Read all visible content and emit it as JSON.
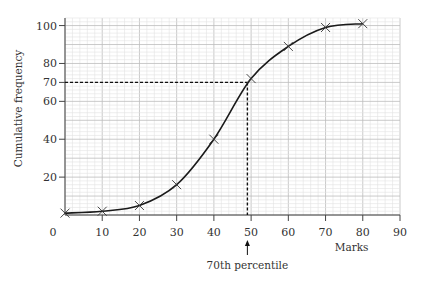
{
  "chart_data": {
    "type": "line",
    "title": "",
    "xlabel": "Marks",
    "ylabel": "Cumulative frequency",
    "xlim": [
      0,
      90
    ],
    "ylim": [
      0,
      104
    ],
    "x_ticks": [
      0,
      10,
      20,
      30,
      40,
      50,
      60,
      70,
      80,
      90
    ],
    "x_tick_labels": [
      "0",
      "10",
      "20",
      "30",
      "40",
      "50",
      "60",
      "70",
      "80",
      "90"
    ],
    "y_ticks": [
      20,
      40,
      60,
      70,
      80,
      100
    ],
    "y_tick_labels": [
      "20",
      "40",
      "60",
      "70",
      "80",
      "100"
    ],
    "grid": true,
    "series": [
      {
        "name": "Cumulative frequency",
        "marker": "x",
        "smooth": true,
        "x": [
          0,
          10,
          20,
          30,
          40,
          50,
          60,
          70,
          80
        ],
        "y": [
          1,
          2,
          5,
          16,
          40,
          72,
          89,
          99,
          101
        ]
      }
    ],
    "annotations": [
      {
        "type": "percentile-guide",
        "label": "70th percentile",
        "y_value": 70,
        "x_value": 49,
        "arrow": "up"
      }
    ]
  }
}
